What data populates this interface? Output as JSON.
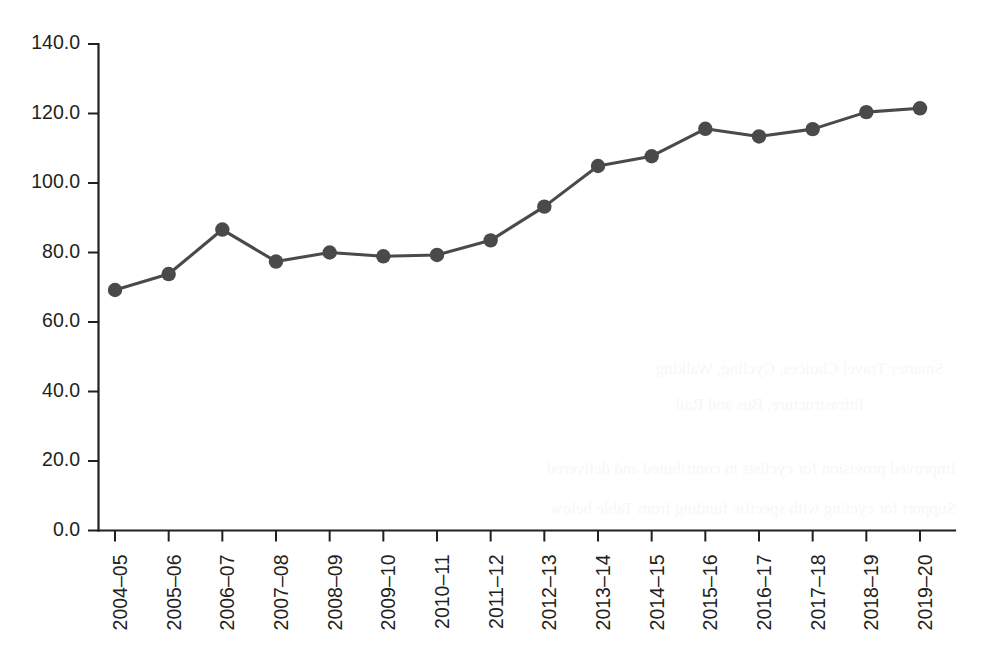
{
  "chart_data": {
    "type": "line",
    "title": "",
    "subtitle": "",
    "xlabel": "",
    "ylabel": "",
    "categories": [
      "2004–05",
      "2005–06",
      "2006–07",
      "2007–08",
      "2008–09",
      "2009–10",
      "2010–11",
      "2011–12",
      "2012–13",
      "2013–14",
      "2014–15",
      "2015–16",
      "2016–17",
      "2017–18",
      "2018–19",
      "2019–20"
    ],
    "values": [
      69.2,
      73.8,
      86.6,
      77.4,
      80.0,
      78.9,
      79.3,
      83.5,
      93.2,
      104.9,
      107.7,
      115.6,
      113.4,
      115.5,
      120.4,
      121.5
    ],
    "series": [
      {
        "name": "series-1",
        "values": [
          69.2,
          73.8,
          86.6,
          77.4,
          80.0,
          78.9,
          79.3,
          83.5,
          93.2,
          104.9,
          107.7,
          115.6,
          113.4,
          115.5,
          120.4,
          121.5
        ]
      }
    ],
    "ylim": [
      0.0,
      140.0
    ],
    "ytick_values": [
      0.0,
      20.0,
      40.0,
      60.0,
      80.0,
      100.0,
      120.0,
      140.0
    ],
    "ytick_labels": [
      "0.0",
      "20.0",
      "40.0",
      "60.0",
      "80.0",
      "100.0",
      "120.0",
      "140.0"
    ],
    "grid": false,
    "legend": false,
    "legend_position": "none",
    "marker": "circle",
    "line_color": "#4a4a4a",
    "marker_color": "#4a4a4a",
    "axis_color": "#231f20",
    "background_color": "#ffffff",
    "xtick_label_rotation": 90
  },
  "bleed_through": {
    "lines": [
      "Smarter Travel Choices, Cycling, Walking",
      "Infrastructure, Bus and Rail",
      "Improved provision for cyclists in contributed and delivered",
      "Support for cycling with specific funding from Table below"
    ]
  }
}
